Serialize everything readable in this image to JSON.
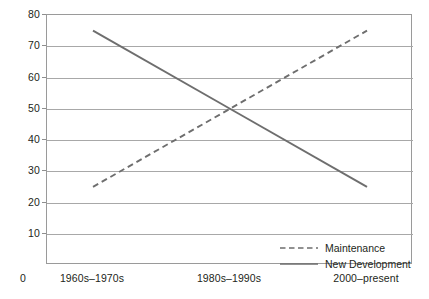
{
  "chart_data": {
    "type": "line",
    "title": "",
    "xlabel": "",
    "ylabel": "",
    "categories": [
      "1960s–1970s",
      "1980s–1990s",
      "2000–present"
    ],
    "ylim": [
      0,
      80
    ],
    "yticks": [
      0,
      10,
      20,
      30,
      40,
      50,
      60,
      70,
      80
    ],
    "ytick_labels": [
      "0",
      "10",
      "20",
      "30",
      "40",
      "50",
      "60",
      "70",
      "80"
    ],
    "grid": true,
    "legend_position": "inside lower-right",
    "series": [
      {
        "name": "Maintenance",
        "style": "dashed",
        "color": "#6e6e6e",
        "values": [
          25,
          50,
          75
        ]
      },
      {
        "name": "New Development",
        "style": "solid",
        "color": "#6e6e6e",
        "values": [
          75,
          50,
          25
        ]
      }
    ]
  },
  "axis": {
    "origin_label": "0",
    "frame_color": "#9a9a9a",
    "gridline_color": "#a8a8a8"
  },
  "legend": {
    "items": [
      {
        "label": "Maintenance",
        "style": "dashed"
      },
      {
        "label": "New Development",
        "style": "solid"
      }
    ]
  }
}
